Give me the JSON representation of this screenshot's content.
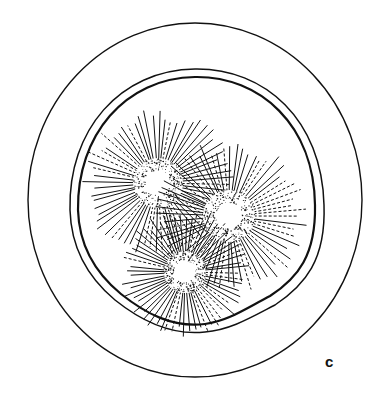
{
  "figure": {
    "panel_label": "c",
    "colors": {
      "ink": "#111111",
      "background": "#ffffff"
    },
    "outer_ring": {
      "cx": 195,
      "cy": 200,
      "rx": 167,
      "ry": 177
    },
    "inner_wall": [
      {
        "name": "outer-wall-line",
        "stroke": 1.6
      },
      {
        "name": "inner-wall-line",
        "stroke": 2.2
      }
    ],
    "spheres": [
      {
        "name": "sphere-top-left",
        "cx": 158,
        "cy": 183,
        "r": 25,
        "spine_len": 50
      },
      {
        "name": "sphere-right",
        "cx": 229,
        "cy": 216,
        "r": 26,
        "spine_len": 50
      },
      {
        "name": "sphere-bottom",
        "cx": 185,
        "cy": 272,
        "r": 21,
        "spine_len": 42
      }
    ]
  }
}
